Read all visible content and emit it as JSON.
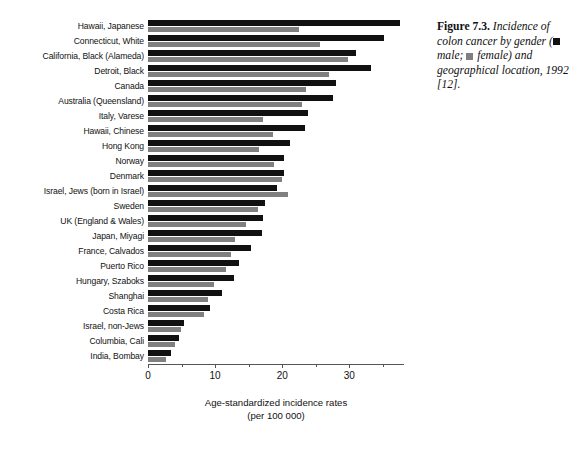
{
  "caption": {
    "head": "Figure 7.3.",
    "text_before_legend": " Incidence of colon cancer by gender (",
    "male_label": " male; ",
    "female_label": " female",
    "text_after_legend": ") and geographical location, 1992 [12]."
  },
  "legend": {
    "male": "male",
    "female": "female",
    "male_color": "#111111",
    "female_color": "#808080"
  },
  "axis": {
    "x_title_line1": "Age-standardized incidence rates",
    "x_title_line2": "(per 100 000)",
    "tick_labels": [
      "0",
      "10",
      "20",
      "30"
    ],
    "tick_values": [
      0,
      10,
      20,
      30
    ]
  },
  "chart_data": {
    "type": "bar",
    "orientation": "horizontal",
    "xlabel": "Age-standardized incidence rates (per 100 000)",
    "ylabel": "",
    "xlim": [
      0,
      38
    ],
    "grid": false,
    "legend_position": "caption",
    "categories": [
      "Hawaii, Japanese",
      "Connecticut, White",
      "California, Black (Alameda)",
      "Detroit, Black",
      "Canada",
      "Australia (Queensland)",
      "Italy, Varese",
      "Hawaii, Chinese",
      "Hong Kong",
      "Norway",
      "Denmark",
      "Israel, Jews (born in Israel)",
      "Sweden",
      "UK (England & Wales)",
      "Japan, Miyagi",
      "France, Calvados",
      "Puerto Rico",
      "Hungary, Szaboks",
      "Shanghai",
      "Costa Rica",
      "Israel, non-Jews",
      "Columbia, Cali",
      "India, Bombay"
    ],
    "series": [
      {
        "name": "male",
        "color": "#111111",
        "values": [
          37.5,
          35.2,
          31.0,
          33.2,
          28.0,
          27.6,
          23.8,
          23.4,
          21.2,
          20.3,
          20.2,
          19.2,
          17.5,
          17.2,
          17.0,
          15.4,
          13.5,
          12.8,
          11.0,
          9.2,
          5.4,
          4.6,
          3.4
        ]
      },
      {
        "name": "female",
        "color": "#808080",
        "values": [
          22.5,
          25.6,
          29.8,
          26.9,
          23.5,
          23.0,
          17.2,
          18.7,
          16.6,
          18.8,
          19.9,
          20.9,
          16.4,
          14.6,
          13.0,
          12.4,
          11.6,
          9.9,
          9.0,
          8.3,
          4.9,
          4.0,
          2.7
        ]
      }
    ]
  }
}
